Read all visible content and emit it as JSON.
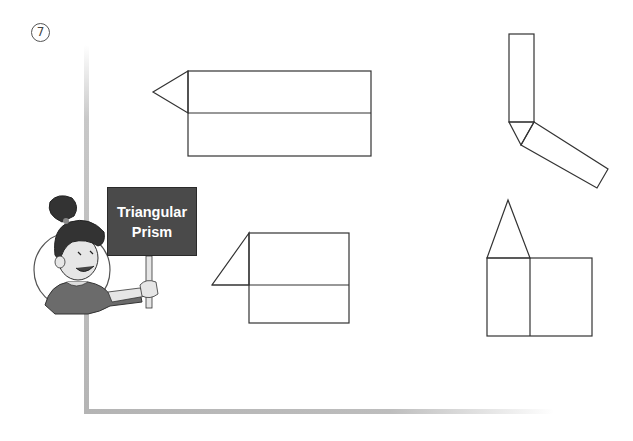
{
  "question": {
    "number_glyph": "7"
  },
  "character": {
    "sign_line1": "Triangular",
    "sign_line2": "Prism"
  },
  "nets": [
    {
      "id": "net-1",
      "description": "Two stacked rectangles with a triangle attached on the left"
    },
    {
      "id": "net-2",
      "description": "Vertical rectangle, triangle, and tilted rectangle forming an L"
    },
    {
      "id": "net-3",
      "description": "Two stacked rectangles with a right triangle attached on the upper-left"
    },
    {
      "id": "net-4",
      "description": "Two side-by-side rectangles with a triangle on top of the left one"
    }
  ],
  "colors": {
    "line": "#333333",
    "frame": "#b4b4b4",
    "sign_bg": "#4a4a4a"
  }
}
